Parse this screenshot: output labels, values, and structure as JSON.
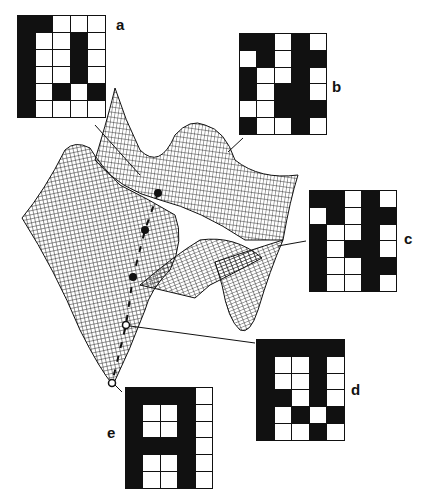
{
  "figure": {
    "colors": {
      "ink": "#111111",
      "paper": "#ffffff"
    },
    "patterns": [
      {
        "label": "a",
        "x": 17,
        "y": 15,
        "w": 89,
        "h": 103,
        "label_x": 116,
        "label_y": 16,
        "line": [
          [
            95,
            125
          ],
          [
            140,
            175
          ]
        ],
        "cells": [
          [
            1,
            1,
            0,
            0,
            0
          ],
          [
            1,
            0,
            0,
            1,
            0
          ],
          [
            1,
            0,
            0,
            1,
            0
          ],
          [
            1,
            0,
            0,
            1,
            0
          ],
          [
            1,
            0,
            1,
            0,
            1
          ],
          [
            1,
            0,
            0,
            0,
            0
          ]
        ]
      },
      {
        "label": "b",
        "x": 239,
        "y": 33,
        "w": 88,
        "h": 102,
        "label_x": 332,
        "label_y": 78,
        "line": [
          [
            243,
            138
          ],
          [
            228,
            152
          ]
        ],
        "cells": [
          [
            1,
            1,
            0,
            1,
            0
          ],
          [
            0,
            1,
            0,
            1,
            1
          ],
          [
            1,
            0,
            0,
            1,
            0
          ],
          [
            1,
            0,
            1,
            1,
            0
          ],
          [
            0,
            0,
            1,
            1,
            1
          ],
          [
            1,
            0,
            0,
            1,
            0
          ]
        ]
      },
      {
        "label": "c",
        "x": 309,
        "y": 190,
        "w": 88,
        "h": 102,
        "label_x": 404,
        "label_y": 230,
        "line": [
          [
            306,
            241
          ],
          [
            278,
            246
          ]
        ],
        "cells": [
          [
            1,
            1,
            0,
            1,
            0
          ],
          [
            0,
            1,
            0,
            1,
            1
          ],
          [
            1,
            0,
            0,
            1,
            0
          ],
          [
            1,
            0,
            1,
            1,
            0
          ],
          [
            1,
            0,
            0,
            1,
            1
          ],
          [
            1,
            0,
            0,
            1,
            0
          ]
        ]
      },
      {
        "label": "d",
        "x": 256,
        "y": 339,
        "w": 89,
        "h": 102,
        "label_x": 351,
        "label_y": 381,
        "line": [
          [
            255,
            343
          ],
          [
            130,
            326
          ]
        ],
        "cells": [
          [
            1,
            1,
            1,
            1,
            1
          ],
          [
            1,
            0,
            0,
            1,
            0
          ],
          [
            1,
            0,
            0,
            1,
            0
          ],
          [
            1,
            1,
            0,
            1,
            0
          ],
          [
            1,
            0,
            1,
            0,
            1
          ],
          [
            1,
            0,
            0,
            1,
            0
          ]
        ]
      },
      {
        "label": "e",
        "x": 125,
        "y": 387,
        "w": 88,
        "h": 102,
        "label_x": 107,
        "label_y": 424,
        "line": [
          [
            122,
            392
          ],
          [
            113,
            383
          ]
        ],
        "cells": [
          [
            1,
            1,
            1,
            1,
            0
          ],
          [
            1,
            0,
            0,
            1,
            0
          ],
          [
            1,
            0,
            0,
            1,
            0
          ],
          [
            1,
            1,
            1,
            1,
            0
          ],
          [
            1,
            0,
            0,
            1,
            0
          ],
          [
            1,
            0,
            0,
            1,
            0
          ]
        ]
      }
    ],
    "trajectory": {
      "filled_points": [
        [
          158,
          193
        ],
        [
          145,
          230
        ],
        [
          133,
          277
        ]
      ],
      "open_points": [
        [
          126,
          325
        ],
        [
          112,
          383
        ]
      ]
    }
  }
}
